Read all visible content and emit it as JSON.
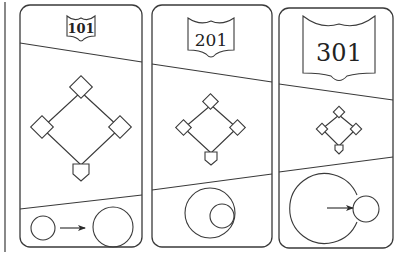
{
  "figure": {
    "colors": {
      "stroke": "#3a3a3a",
      "background": "#ffffff"
    },
    "panels": [
      {
        "id": "panel-101",
        "badge_label": "101",
        "diamond_scale": "large",
        "bottom_relation": "small circle grows into larger circle"
      },
      {
        "id": "panel-201",
        "badge_label": "201",
        "diamond_scale": "medium",
        "bottom_relation": "small circle nested inside larger circle"
      },
      {
        "id": "panel-301",
        "badge_label": "301",
        "diamond_scale": "small",
        "bottom_relation": "arrow pushes from inside large circle to small circle outside its edge"
      }
    ]
  }
}
